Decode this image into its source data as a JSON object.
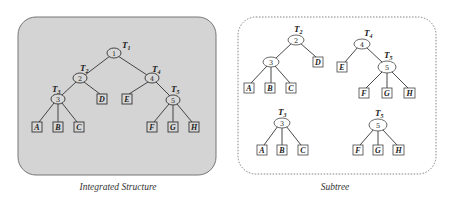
{
  "panels": {
    "left": {
      "caption": "Integrated Structure",
      "fill": "#d4d4d4",
      "tree": {
        "nodes": [
          {
            "id": "1",
            "x": 114,
            "y": 53,
            "tag": "T",
            "tag_sub": "1"
          },
          {
            "id": "2",
            "x": 80,
            "y": 78,
            "tag": "T",
            "tag_sub": "2"
          },
          {
            "id": "3",
            "x": 58,
            "y": 99,
            "tag": "T",
            "tag_sub": "3"
          },
          {
            "id": "4",
            "x": 152,
            "y": 78,
            "tag": "T",
            "tag_sub": "4"
          },
          {
            "id": "5",
            "x": 173,
            "y": 100,
            "tag": "T",
            "tag_sub": "5"
          }
        ],
        "leaves": [
          {
            "label": "A",
            "x": 37,
            "y": 127
          },
          {
            "label": "B",
            "x": 58,
            "y": 127
          },
          {
            "label": "C",
            "x": 79,
            "y": 127
          },
          {
            "label": "D",
            "x": 102,
            "y": 99
          },
          {
            "label": "E",
            "x": 127,
            "y": 99
          },
          {
            "label": "F",
            "x": 152,
            "y": 127
          },
          {
            "label": "G",
            "x": 173,
            "y": 127
          },
          {
            "label": "H",
            "x": 194,
            "y": 127
          }
        ]
      }
    },
    "right": {
      "caption": "Subtree",
      "subtrees": [
        {
          "name": "T2",
          "tag": "T",
          "tag_sub": "2",
          "root": "2",
          "internal": [
            "3"
          ],
          "leaves": [
            "A",
            "B",
            "C",
            "D"
          ]
        },
        {
          "name": "T4",
          "tag": "T",
          "tag_sub": "4",
          "root": "4",
          "internal": [
            "5"
          ],
          "leaves": [
            "E",
            "F",
            "G",
            "H"
          ],
          "child_tag": "T",
          "child_tag_sub": "5"
        },
        {
          "name": "T3",
          "tag": "T",
          "tag_sub": "3",
          "root": "3",
          "leaves": [
            "A",
            "B",
            "C"
          ]
        },
        {
          "name": "T5",
          "tag": "T",
          "tag_sub": "5",
          "root": "5",
          "leaves": [
            "F",
            "G",
            "H"
          ]
        }
      ]
    }
  },
  "labels": {
    "n1": "1",
    "n2": "2",
    "n3": "3",
    "n4": "4",
    "n5": "5",
    "A": "A",
    "B": "B",
    "C": "C",
    "D": "D",
    "E": "E",
    "F": "F",
    "G": "G",
    "H": "H",
    "T": "T",
    "s1": "1",
    "s2": "2",
    "s3": "3",
    "s4": "4",
    "s5": "5"
  }
}
